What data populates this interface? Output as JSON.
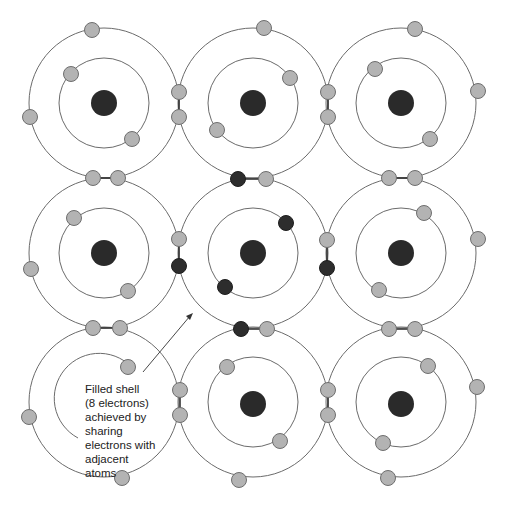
{
  "diagram": {
    "title": "",
    "colors": {
      "background": "#ffffff",
      "orbit": "#6b6b6b",
      "nucleus": "#2a2a2a",
      "shared_electron_light": "#b3b3b3",
      "highlighted_electron_dark": "#2d2d2d",
      "bond_line": "#333333",
      "text": "#222222"
    },
    "grid": {
      "rows": 3,
      "cols": 3,
      "outer_radius": 75,
      "inner_radius": 45
    },
    "atoms": [
      {
        "id": "atom-top-left",
        "row": 0,
        "col": 0,
        "highlighted": false
      },
      {
        "id": "atom-top-center",
        "row": 0,
        "col": 1,
        "highlighted": false
      },
      {
        "id": "atom-top-right",
        "row": 0,
        "col": 2,
        "highlighted": false
      },
      {
        "id": "atom-middle-left",
        "row": 1,
        "col": 0,
        "highlighted": false
      },
      {
        "id": "atom-center",
        "row": 1,
        "col": 1,
        "highlighted": true
      },
      {
        "id": "atom-middle-right",
        "row": 1,
        "col": 2,
        "highlighted": false
      },
      {
        "id": "atom-bottom-left",
        "row": 2,
        "col": 0,
        "highlighted": false
      },
      {
        "id": "atom-bottom-center",
        "row": 2,
        "col": 1,
        "highlighted": false
      },
      {
        "id": "atom-bottom-right",
        "row": 2,
        "col": 2,
        "highlighted": false
      }
    ],
    "annotation": {
      "lines": [
        "Filled shell",
        "(8 electrons)",
        "achieved by",
        "sharing",
        "electrons with",
        "adjacent",
        "atoms"
      ],
      "points_to": "atom-center"
    }
  }
}
